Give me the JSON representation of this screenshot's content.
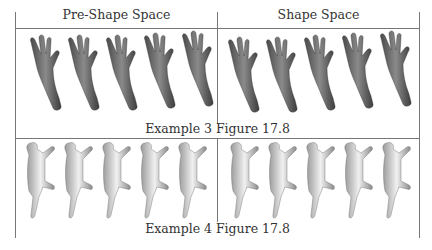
{
  "table": {
    "columns": [
      {
        "label": "Pre-Shape Space"
      },
      {
        "label": "Shape Space"
      }
    ],
    "rows": [
      {
        "caption": "Example 3 Figure 17.8",
        "subject": "hand",
        "count_per_cell": 5
      },
      {
        "caption": "Example 4 Figure 17.8",
        "subject": "cat",
        "count_per_cell": 5
      }
    ]
  },
  "colors": {
    "border": "#777777",
    "hand_fill": "#6e6e6e",
    "cat_fill": "#bdbdbd"
  }
}
